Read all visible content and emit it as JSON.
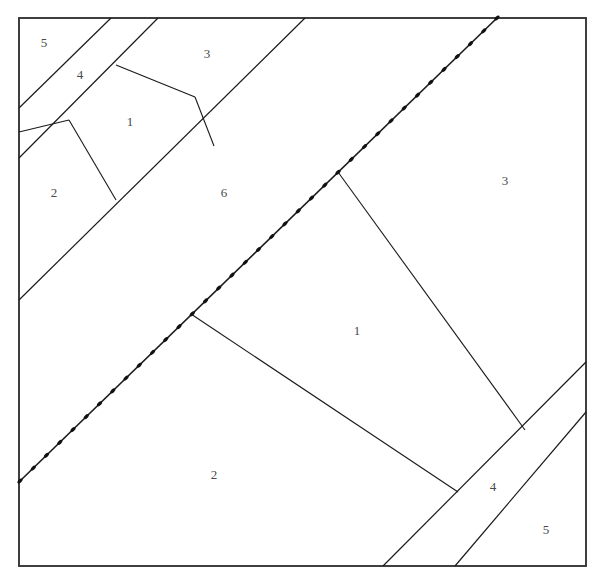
{
  "figure": {
    "background_color": "#ffffff",
    "line_color": "#1a1a1a",
    "label_color": "#4a4a4a",
    "frame": {
      "x": 19,
      "y": 18,
      "width": 567,
      "height": 548
    }
  },
  "labels": [
    {
      "id": "label-5-topleft",
      "text": "5",
      "x": 44,
      "y": 44
    },
    {
      "id": "label-4-topleft",
      "text": "4",
      "x": 80,
      "y": 76
    },
    {
      "id": "label-3-top",
      "text": "3",
      "x": 207,
      "y": 55
    },
    {
      "id": "label-1-topleft",
      "text": "1",
      "x": 130,
      "y": 123
    },
    {
      "id": "label-2-left",
      "text": "2",
      "x": 54,
      "y": 194
    },
    {
      "id": "label-6-center",
      "text": "6",
      "x": 224,
      "y": 194
    },
    {
      "id": "label-3-right",
      "text": "3",
      "x": 505,
      "y": 182
    },
    {
      "id": "label-1-center",
      "text": "1",
      "x": 357,
      "y": 332
    },
    {
      "id": "label-2-bottom",
      "text": "2",
      "x": 214,
      "y": 476
    },
    {
      "id": "label-4-bottomright",
      "text": "4",
      "x": 493,
      "y": 488
    },
    {
      "id": "label-5-bottomright",
      "text": "5",
      "x": 546,
      "y": 531
    }
  ],
  "boundaries": [
    {
      "id": "road-topleft-upper-edge",
      "x1": 19,
      "y1": 158,
      "x2": 158,
      "y2": 18
    },
    {
      "id": "road-topleft-lower-edge",
      "x1": 19,
      "y1": 108,
      "x2": 111,
      "y2": 18
    },
    {
      "id": "road-topleft-inner-edge",
      "x1": 19,
      "y1": 300,
      "x2": 305,
      "y2": 18
    },
    {
      "id": "parcel-1-left-edge",
      "x1": 69,
      "y1": 120,
      "x2": 116,
      "y2": 200
    },
    {
      "id": "parcel-1-top-edge",
      "x1": 116,
      "y1": 65,
      "x2": 195,
      "y2": 97
    },
    {
      "id": "parcel-1-right-edge",
      "x1": 195,
      "y1": 97,
      "x2": 214,
      "y2": 146
    },
    {
      "id": "parcel-1-lower-left-edge",
      "x1": 69,
      "y1": 120,
      "x2": 19,
      "y2": 132
    },
    {
      "id": "branch-to-road-upper",
      "x1": 338,
      "y1": 172,
      "x2": 525,
      "y2": 430
    },
    {
      "id": "branch-to-road-lower",
      "x1": 191,
      "y1": 314,
      "x2": 458,
      "y2": 492
    },
    {
      "id": "road-bottomright-upper-edge",
      "x1": 383,
      "y1": 566,
      "x2": 586,
      "y2": 362
    },
    {
      "id": "road-bottomright-lower-edge",
      "x1": 455,
      "y1": 566,
      "x2": 586,
      "y2": 412
    }
  ],
  "beaded_line": {
    "id": "surveyed-boundary",
    "style": "beaded",
    "x1": 20,
    "y1": 481,
    "x2": 497,
    "y2": 18,
    "bead_count": 36
  }
}
